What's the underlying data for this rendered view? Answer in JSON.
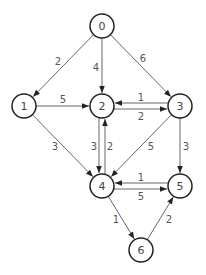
{
  "graph": {
    "type": "directed-weighted",
    "nodes": [
      {
        "id": "0",
        "x": 102,
        "y": 26
      },
      {
        "id": "1",
        "x": 24,
        "y": 106
      },
      {
        "id": "2",
        "x": 102,
        "y": 106
      },
      {
        "id": "3",
        "x": 180,
        "y": 106
      },
      {
        "id": "4",
        "x": 102,
        "y": 186
      },
      {
        "id": "5",
        "x": 180,
        "y": 186
      },
      {
        "id": "6",
        "x": 141,
        "y": 250
      }
    ],
    "edges": [
      {
        "from": "0",
        "to": "1",
        "weight": "2",
        "lx": 58,
        "ly": 61
      },
      {
        "from": "0",
        "to": "2",
        "weight": "4",
        "lx": 96,
        "ly": 67
      },
      {
        "from": "0",
        "to": "3",
        "weight": "6",
        "lx": 143,
        "ly": 58
      },
      {
        "from": "1",
        "to": "2",
        "weight": "5",
        "lx": 63,
        "ly": 99
      },
      {
        "from": "3",
        "to": "2",
        "weight": "1",
        "lx": 141,
        "ly": 97
      },
      {
        "from": "2",
        "to": "3",
        "weight": "2",
        "lx": 141,
        "ly": 116
      },
      {
        "from": "1",
        "to": "4",
        "weight": "3",
        "lx": 55,
        "ly": 146
      },
      {
        "from": "4",
        "to": "2",
        "weight": "3",
        "lx": 94,
        "ly": 146
      },
      {
        "from": "2",
        "to": "4",
        "weight": "2",
        "lx": 110,
        "ly": 146
      },
      {
        "from": "3",
        "to": "4",
        "weight": "5",
        "lx": 151,
        "ly": 146
      },
      {
        "from": "3",
        "to": "5",
        "weight": "3",
        "lx": 186,
        "ly": 146
      },
      {
        "from": "5",
        "to": "4",
        "weight": "1",
        "lx": 141,
        "ly": 177
      },
      {
        "from": "4",
        "to": "5",
        "weight": "5",
        "lx": 141,
        "ly": 196
      },
      {
        "from": "4",
        "to": "6",
        "weight": "1",
        "lx": 116,
        "ly": 219
      },
      {
        "from": "6",
        "to": "5",
        "weight": "2",
        "lx": 169,
        "ly": 219
      }
    ]
  }
}
